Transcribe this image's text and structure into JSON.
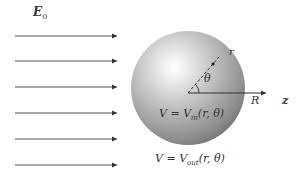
{
  "diagram": {
    "field_label": "E",
    "field_subscript": "0",
    "radius_label": "R",
    "axis_label": "z",
    "r_label": "r",
    "theta_label": "θ",
    "inside_potential": "V = V",
    "inside_sub": "in",
    "inside_args": "(r, θ)",
    "outside_potential": "V = V",
    "outside_sub": "out",
    "outside_args": "(r, θ)",
    "arrows": [
      36,
      61,
      87,
      113,
      139,
      165
    ],
    "sphere": {
      "cx": 188,
      "cy": 88,
      "r": 57
    },
    "colors": {
      "arrow": "#444444",
      "sphere_dark": "#6e6e6e",
      "sphere_light": "#ffffff",
      "text": "#333333"
    }
  }
}
